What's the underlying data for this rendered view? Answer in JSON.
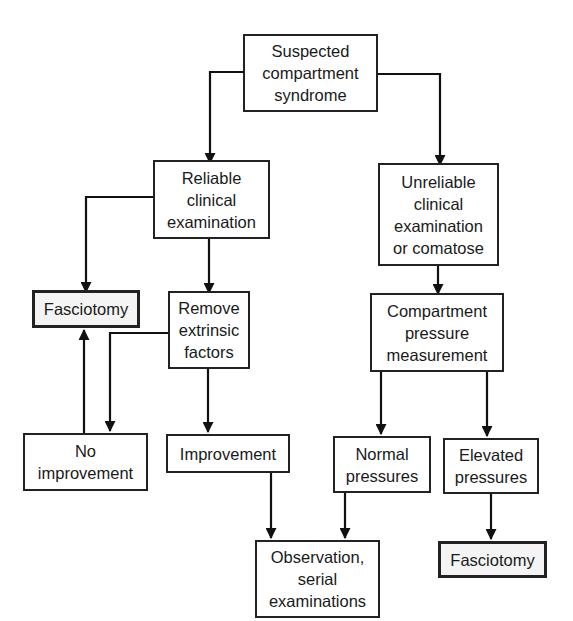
{
  "diagram": {
    "type": "flowchart",
    "nodes": {
      "suspected": {
        "lines": [
          "Suspected",
          "compartment",
          "syndrome"
        ]
      },
      "reliable": {
        "lines": [
          "Reliable",
          "clinical",
          "examination"
        ]
      },
      "unreliable": {
        "lines": [
          "Unreliable",
          "clinical",
          "examination",
          "or comatose"
        ]
      },
      "fasciotomy_left": {
        "lines": [
          "Fasciotomy"
        ]
      },
      "remove_factors": {
        "lines": [
          "Remove",
          "extrinsic",
          "factors"
        ]
      },
      "compartment_pressure": {
        "lines": [
          "Compartment",
          "pressure",
          "measurement"
        ]
      },
      "no_improvement": {
        "lines": [
          "No",
          "improvement"
        ]
      },
      "improvement": {
        "lines": [
          "Improvement"
        ]
      },
      "normal_pressures": {
        "lines": [
          "Normal",
          "pressures"
        ]
      },
      "elevated_pressures": {
        "lines": [
          "Elevated",
          "pressures"
        ]
      },
      "observation": {
        "lines": [
          "Observation,",
          "serial",
          "examinations"
        ]
      },
      "fasciotomy_right": {
        "lines": [
          "Fasciotomy"
        ]
      }
    },
    "edges": [
      {
        "from": "suspected",
        "to": "reliable"
      },
      {
        "from": "suspected",
        "to": "unreliable"
      },
      {
        "from": "reliable",
        "to": "fasciotomy_left"
      },
      {
        "from": "reliable",
        "to": "remove_factors"
      },
      {
        "from": "unreliable",
        "to": "compartment_pressure"
      },
      {
        "from": "remove_factors",
        "to": "no_improvement"
      },
      {
        "from": "remove_factors",
        "to": "improvement"
      },
      {
        "from": "no_improvement",
        "to": "fasciotomy_left"
      },
      {
        "from": "compartment_pressure",
        "to": "normal_pressures"
      },
      {
        "from": "compartment_pressure",
        "to": "elevated_pressures"
      },
      {
        "from": "improvement",
        "to": "observation"
      },
      {
        "from": "normal_pressures",
        "to": "observation"
      },
      {
        "from": "elevated_pressures",
        "to": "fasciotomy_right"
      }
    ],
    "colors": {
      "stroke": "#222222",
      "action_fill": "#f4f4f4",
      "node_fill": "#ffffff"
    }
  }
}
